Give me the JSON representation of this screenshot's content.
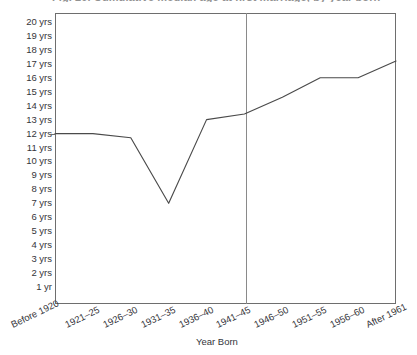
{
  "figure": {
    "caption": "Fig. 20. Cumulative median age at first marriage, by year born",
    "caption_clipped": true
  },
  "chart_data": {
    "type": "line",
    "title": "Fig. 20. Cumulative median age at first marriage, by year born",
    "xlabel": "Year Born",
    "ylabel": "",
    "categories": [
      "Before 1920",
      "1921–25",
      "1926–30",
      "1931–35",
      "1936–40",
      "1941–45",
      "1946–50",
      "1951–55",
      "1956–60",
      "After 1961"
    ],
    "values": [
      12.0,
      12.0,
      11.7,
      7.0,
      13.0,
      13.4,
      14.6,
      16.0,
      16.0,
      17.2
    ],
    "ylim": [
      0,
      20.5
    ],
    "ytick_values": [
      20,
      19,
      18,
      17,
      16,
      15,
      14,
      13,
      12,
      11,
      10,
      9,
      8,
      7,
      6,
      5,
      4,
      3,
      2,
      1
    ],
    "ytick_labels": [
      "20 yrs",
      "19 yrs",
      "18 yrs",
      "17 yrs",
      "16 yrs",
      "15 yrs",
      "14 yrs",
      "13 yrs",
      "12 yrs",
      "11 yrs",
      "10 yrs",
      "9 yrs",
      "8 yrs",
      "7 yrs",
      "6 yrs",
      "5 yrs",
      "4 yrs",
      "3 yrs",
      "2 yrs",
      "1 yr"
    ],
    "grid": false,
    "legend": null,
    "annotations": [
      {
        "type": "vertical-reference-line",
        "between": [
          "1941–45",
          "1946–50"
        ],
        "label": ""
      }
    ],
    "line_color": "#4a4a4a",
    "axis_color": "#6e6e6e"
  }
}
